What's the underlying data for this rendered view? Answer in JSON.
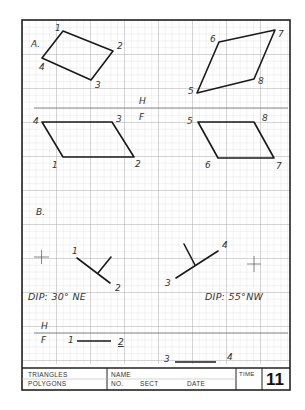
{
  "sheet": {
    "grid": {
      "fine_spacing_px": 6.8,
      "major_every": 5,
      "fine_color": "#d4d4d4",
      "major_color": "#b3b3b3"
    },
    "border_color": "#222222",
    "line_color": "#1a1a1a"
  },
  "section_a": {
    "label": "A.",
    "fold_line": {
      "upper": "H",
      "lower": "F"
    },
    "top_view_quad_1": {
      "vertices": [
        {
          "label": "1",
          "x": 63,
          "y": 31
        },
        {
          "label": "2",
          "x": 113,
          "y": 51
        },
        {
          "label": "3",
          "x": 91,
          "y": 80
        },
        {
          "label": "4",
          "x": 42,
          "y": 58
        }
      ]
    },
    "top_view_quad_2": {
      "vertices": [
        {
          "label": "6",
          "x": 219,
          "y": 42
        },
        {
          "label": "7",
          "x": 275,
          "y": 30
        },
        {
          "label": "8",
          "x": 254,
          "y": 79
        },
        {
          "label": "5",
          "x": 197,
          "y": 93
        }
      ]
    },
    "front_view_quad_1": {
      "vertices": [
        {
          "label": "4",
          "x": 42,
          "y": 122
        },
        {
          "label": "3",
          "x": 112,
          "y": 122
        },
        {
          "label": "2",
          "x": 134,
          "y": 157
        },
        {
          "label": "1",
          "x": 63,
          "y": 157
        }
      ]
    },
    "front_view_quad_2": {
      "vertices": [
        {
          "label": "5",
          "x": 198,
          "y": 122
        },
        {
          "label": "8",
          "x": 254,
          "y": 122
        },
        {
          "label": "7",
          "x": 274,
          "y": 158
        },
        {
          "label": "6",
          "x": 218,
          "y": 158
        }
      ]
    }
  },
  "section_b": {
    "label": "B.",
    "strike_left": {
      "p1": "1",
      "p2": "2",
      "dip_text": "DIP:  30° NE"
    },
    "strike_right": {
      "p1": "3",
      "p2": "4",
      "dip_text": "DIP:  55°NW"
    },
    "fold_line": {
      "upper": "H",
      "lower": "F"
    },
    "bottom_line_left": {
      "p1": "1",
      "p2": "2"
    },
    "bottom_line_right": {
      "p1": "3",
      "p2": "4"
    }
  },
  "title_block": {
    "title_line_1": "TRIANGLES",
    "title_line_2": "POLYGONS",
    "name_label": "NAME",
    "no_label": "NO.",
    "sect_label": "SECT",
    "date_label": "DATE",
    "time_label": "TIME",
    "sheet_number": "11"
  }
}
